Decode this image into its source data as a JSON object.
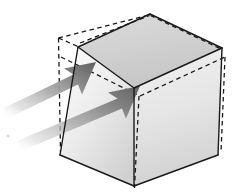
{
  "figure": {
    "background_color": "#ffffff",
    "width": 235,
    "height": 192
  },
  "cube": {
    "name": "box",
    "edge_color": "#1a1a1a",
    "hidden_edge_color": "#1a1a1a",
    "hidden_edge_style": "dashed",
    "edge_width": 1.4,
    "faces": [
      {
        "name": "top-face",
        "label": "top",
        "points": "78,47 150,14 222,48 134,88",
        "fill_start": "#d8d8d8",
        "fill_end": "#c9c9c9"
      },
      {
        "name": "left-front-face",
        "label": "front-left",
        "points": "78,47 134,88 134,186 60,155",
        "fill_start": "#fbfbfb",
        "fill_end": "#d2d2d2"
      },
      {
        "name": "right-front-face",
        "label": "front-right",
        "points": "134,88 222,48 218,155 134,186",
        "fill_start": "#efefef",
        "fill_end": "#d5d5d5"
      }
    ],
    "visible_edges": [
      {
        "name": "edge-top-back-left",
        "x1": 78,
        "y1": 47,
        "x2": 150,
        "y2": 14
      },
      {
        "name": "edge-top-back-right",
        "x1": 150,
        "y1": 14,
        "x2": 222,
        "y2": 48
      },
      {
        "name": "edge-top-front-left",
        "x1": 78,
        "y1": 47,
        "x2": 134,
        "y2": 88
      },
      {
        "name": "edge-top-front-right",
        "x1": 134,
        "y1": 88,
        "x2": 222,
        "y2": 48
      },
      {
        "name": "edge-vertical-front",
        "x1": 134,
        "y1": 88,
        "x2": 134,
        "y2": 186
      },
      {
        "name": "edge-vertical-left",
        "x1": 78,
        "y1": 47,
        "x2": 60,
        "y2": 155
      },
      {
        "name": "edge-vertical-right",
        "x1": 222,
        "y1": 48,
        "x2": 218,
        "y2": 155
      },
      {
        "name": "edge-bottom-left",
        "x1": 60,
        "y1": 155,
        "x2": 134,
        "y2": 186
      },
      {
        "name": "edge-bottom-right",
        "x1": 134,
        "y1": 186,
        "x2": 218,
        "y2": 155
      }
    ],
    "hidden_edges": [
      {
        "name": "hidden-edge-back-top-left",
        "x1": 58,
        "y1": 40,
        "x2": 78,
        "y2": 47
      },
      {
        "name": "hidden-edge-back-top-diag",
        "x1": 58,
        "y1": 40,
        "x2": 150,
        "y2": 14
      },
      {
        "name": "hidden-edge-back-horizontal",
        "x1": 58,
        "y1": 58,
        "x2": 140,
        "y2": 96
      },
      {
        "name": "hidden-edge-back-right-diag",
        "x1": 140,
        "y1": 96,
        "x2": 224,
        "y2": 58
      },
      {
        "name": "hidden-edge-back-vertical-left",
        "x1": 58,
        "y1": 40,
        "x2": 58,
        "y2": 150
      },
      {
        "name": "hidden-edge-back-vertical-mid",
        "x1": 139,
        "y1": 96,
        "x2": 134,
        "y2": 188
      },
      {
        "name": "hidden-edge-back-vertical-right",
        "x1": 224,
        "y1": 58,
        "x2": 221,
        "y2": 150
      },
      {
        "name": "hidden-edge-top-rim-left",
        "x1": 80,
        "y1": 44,
        "x2": 150,
        "y2": 17
      },
      {
        "name": "hidden-edge-top-rim-right",
        "x1": 150,
        "y1": 17,
        "x2": 220,
        "y2": 50
      }
    ]
  },
  "arrows": [
    {
      "name": "arrow-upper",
      "label": "upper force arrow",
      "direction": "up-right",
      "tip_x": 96,
      "tip_y": 62,
      "tail_x": 0,
      "tail_y": 112,
      "color_head": "#6e6e6e",
      "color_tail": "#ffffff",
      "shaft_points": "0,105 60,76 60,86 0,118",
      "head_points": "96,62 58,70 70,77 50,88 62,96"
    },
    {
      "name": "arrow-lower",
      "label": "lower force arrow",
      "direction": "up-right",
      "tip_x": 140,
      "tip_y": 86,
      "tail_x": 4,
      "tail_y": 148,
      "color_head": "#6e6e6e",
      "color_tail": "#ffffff",
      "shaft_points": "6,139 104,100 104,110 8,151",
      "head_points": "140,86 102,94 114,101 94,112 106,120"
    }
  ],
  "artifacts": {
    "speck_left": {
      "name": "scan-speck",
      "x": 8,
      "y": 136,
      "color": "#d9d9d9"
    }
  }
}
